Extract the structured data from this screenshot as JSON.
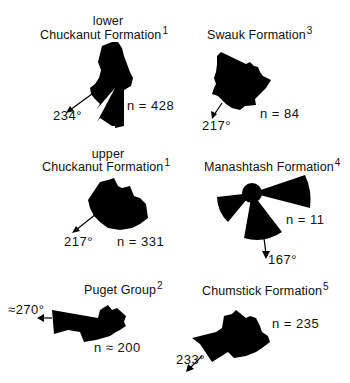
{
  "figure": {
    "panels": [
      {
        "id": "lower-chuckanut",
        "title_line1": "lower",
        "title_line2": "Chuckanut Formation",
        "superscript": "1",
        "n_label": "n = 428",
        "direction_label": "234°",
        "mean_direction_deg": 234,
        "n": 428
      },
      {
        "id": "swauk",
        "title_line1": "",
        "title_line2": "Swauk Formation",
        "superscript": "3",
        "n_label": "n = 84",
        "direction_label": "217°",
        "mean_direction_deg": 217,
        "n": 84
      },
      {
        "id": "upper-chuckanut",
        "title_line1": "upper",
        "title_line2": "Chuckanut Formation",
        "superscript": "1",
        "n_label": "n = 331",
        "direction_label": "217°",
        "mean_direction_deg": 217,
        "n": 331
      },
      {
        "id": "manashtash",
        "title_line1": "",
        "title_line2": "Manashtash Formation",
        "superscript": "4",
        "n_label": "n = 11",
        "direction_label": "167°",
        "mean_direction_deg": 167,
        "n": 11
      },
      {
        "id": "puget",
        "title_line1": "",
        "title_line2": "Puget Group",
        "superscript": "2",
        "n_label": "n ≈ 200",
        "direction_label": "≈270°",
        "mean_direction_deg": 270,
        "n": 200
      },
      {
        "id": "chumstick",
        "title_line1": "",
        "title_line2": "Chumstick Formation",
        "superscript": "5",
        "n_label": "n = 235",
        "direction_label": "233°",
        "mean_direction_deg": 233,
        "n": 235
      }
    ]
  },
  "colors": {
    "fill": "#000000",
    "text": "#111111",
    "background": "#ffffff"
  }
}
